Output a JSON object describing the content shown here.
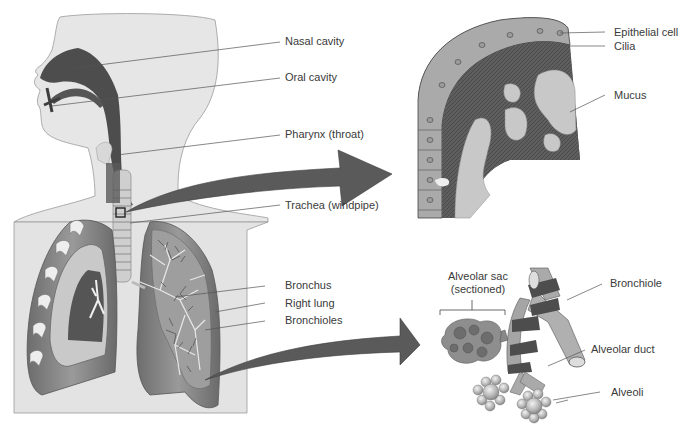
{
  "figure": {
    "panels": {
      "body": {
        "labels": [
          {
            "id": "nasal-cavity",
            "text": "Nasal cavity"
          },
          {
            "id": "oral-cavity",
            "text": "Oral cavity"
          },
          {
            "id": "pharynx",
            "text": "Pharynx (throat)"
          },
          {
            "id": "trachea",
            "text": "Trachea (windpipe)"
          },
          {
            "id": "bronchus",
            "text": "Bronchus"
          },
          {
            "id": "right-lung",
            "text": "Right lung"
          },
          {
            "id": "bronchioles",
            "text": "Bronchioles"
          }
        ]
      },
      "trachea_lining": {
        "labels": [
          {
            "id": "epithelial-cell",
            "text": "Epithelial cell"
          },
          {
            "id": "cilia",
            "text": "Cilia"
          },
          {
            "id": "mucus",
            "text": "Mucus"
          }
        ]
      },
      "alveoli_detail": {
        "labels": [
          {
            "id": "alveolar-sac",
            "text": "Alveolar sac"
          },
          {
            "id": "alveolar-sac-sub",
            "text": "(sectioned)"
          },
          {
            "id": "bronchiole",
            "text": "Bronchiole"
          },
          {
            "id": "alveolar-duct",
            "text": "Alveolar duct"
          },
          {
            "id": "alveoli",
            "text": "Alveoli"
          }
        ]
      }
    },
    "colors": {
      "skin": "#e4e4e4",
      "outline": "#8a8a8a",
      "dark_tissue": "#4a4a4a",
      "mid_tissue": "#7a7a7a",
      "light_tissue": "#b8b8b8",
      "arrow": "#5a5a5a",
      "leader_line": "#555555",
      "text": "#3a3a3a"
    }
  }
}
